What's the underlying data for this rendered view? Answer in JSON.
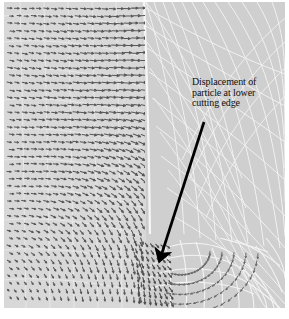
{
  "figure": {
    "name": "fem-displacement-field",
    "background_color": "#ffffff",
    "canvas_color": "#cfcfcf",
    "left_region_color": "#d8d8d8",
    "mesh_line_color": "#f2f2f2",
    "vector_color": "#5a5a5a",
    "annotation_color": "#111111"
  },
  "annotation": {
    "line1": "Displacement of",
    "line2": "particle at lower",
    "line3": "cutting edge",
    "arrow": {
      "tail_x": 204,
      "tail_y": 122,
      "tip_x": 157,
      "tip_y": 266,
      "color": "#000000",
      "width": 2.6
    }
  },
  "regions": {
    "workpiece_label": "dense displacement vector field",
    "chip_label": "deformed mesh region",
    "tool_edge_label": "lower cutting edge fan"
  }
}
